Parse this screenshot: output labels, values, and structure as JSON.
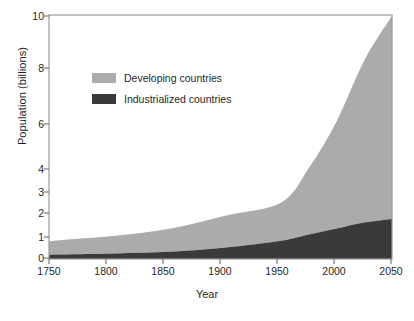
{
  "chart_data": {
    "type": "area",
    "title": "",
    "subtitle": "",
    "xlabel": "Year",
    "ylabel": "Population (billions)",
    "stacked": true,
    "grid": false,
    "legend_position": "inside-upper-left",
    "xlim": [
      1740,
      2050
    ],
    "ylim": [
      0,
      10
    ],
    "x_ticks": [
      1750,
      1800,
      1850,
      1900,
      1950,
      2000,
      2050
    ],
    "x_tick_labels": [
      "1750",
      "1800",
      "1850",
      "1900",
      "1950",
      "2000",
      "2050"
    ],
    "y_ticks": [
      0,
      1,
      2,
      3,
      4,
      6,
      8,
      10
    ],
    "y_tick_labels": [
      "0",
      "1",
      "2",
      "3",
      "4",
      "6",
      "8",
      "10"
    ],
    "y_axis_note": "non-linear: spacing compressed above 4",
    "x": [
      1740,
      1750,
      1800,
      1850,
      1900,
      1950,
      1975,
      2000,
      2025,
      2050
    ],
    "series": [
      {
        "name": "Industrialized countries",
        "color": "#3a3a3a",
        "values": [
          0.16,
          0.17,
          0.22,
          0.3,
          0.5,
          0.82,
          1.1,
          1.35,
          1.6,
          1.75
        ]
      },
      {
        "name": "Developing countries",
        "color": "#ababab",
        "values": [
          0.64,
          0.68,
          0.83,
          1.05,
          1.4,
          1.68,
          2.95,
          4.75,
          6.7,
          8.25
        ]
      }
    ],
    "totals": [
      0.8,
      0.85,
      1.05,
      1.35,
      1.9,
      2.5,
      4.05,
      6.1,
      8.3,
      10.0
    ],
    "annotations": []
  },
  "legend": {
    "items": [
      {
        "label": "Developing countries",
        "color": "#ababab"
      },
      {
        "label": "Industrialized countries",
        "color": "#3a3a3a"
      }
    ]
  },
  "axes": {
    "y_title": "Population (billions)",
    "x_title": "Year",
    "y_labels": [
      "10",
      "8",
      "6",
      "4",
      "3",
      "2",
      "1",
      "0"
    ],
    "x_labels": [
      "1750",
      "1800",
      "1850",
      "1900",
      "1950",
      "2000",
      "2050"
    ]
  },
  "colors": {
    "developing": "#ababab",
    "industrialized": "#3a3a3a",
    "frame": "#9a9a9a",
    "background": "#ffffff",
    "text": "#1f1f1f"
  }
}
